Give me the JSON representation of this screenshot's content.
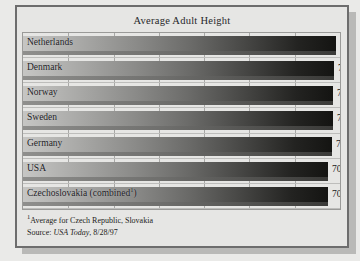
{
  "chart_data": {
    "type": "bar",
    "orientation": "horizontal",
    "title": "Average Adult Height",
    "xlabel": "",
    "ylabel": "",
    "categories": [
      "Netherlands",
      "Denmark",
      "Norway",
      "Sweden",
      "Germany",
      "USA",
      "Czechoslovakia (combined¹)"
    ],
    "values": [
      72.6,
      72.2,
      71.9,
      71.8,
      71.6,
      70.8,
      70.8
    ],
    "value_labels": [
      "72.6 inches",
      "72.2 inches",
      "71.9 inches",
      "71.8 inches",
      "71.6 inches",
      "70.8 inches",
      "70.8 inches"
    ],
    "unit": "inches",
    "grid": true,
    "gridlines_count": 6,
    "legend": null,
    "xlim": [
      0,
      73.5
    ],
    "bar_fill": "gradient light-gray to black",
    "colors": {
      "panel_background": "#e6e6e4",
      "page_background": "#e9e9e7",
      "panel_border": "#6d6d6d",
      "plot_border": "#9a9a98",
      "gridline": "#a8a8a6",
      "bar_start": "#c6c6c4",
      "bar_end": "#141412",
      "text": "#1b1b1f"
    },
    "annotations": [
      "¹Average for Czech Republic, Slovakia",
      "Source: USA Today, 8/28/97"
    ]
  },
  "footnotes": {
    "marker": "1",
    "note": "Average for Czech Republic, Slovakia",
    "source_prefix": "Source: ",
    "source_name": "USA Today",
    "source_date": ", 8/28/97"
  }
}
